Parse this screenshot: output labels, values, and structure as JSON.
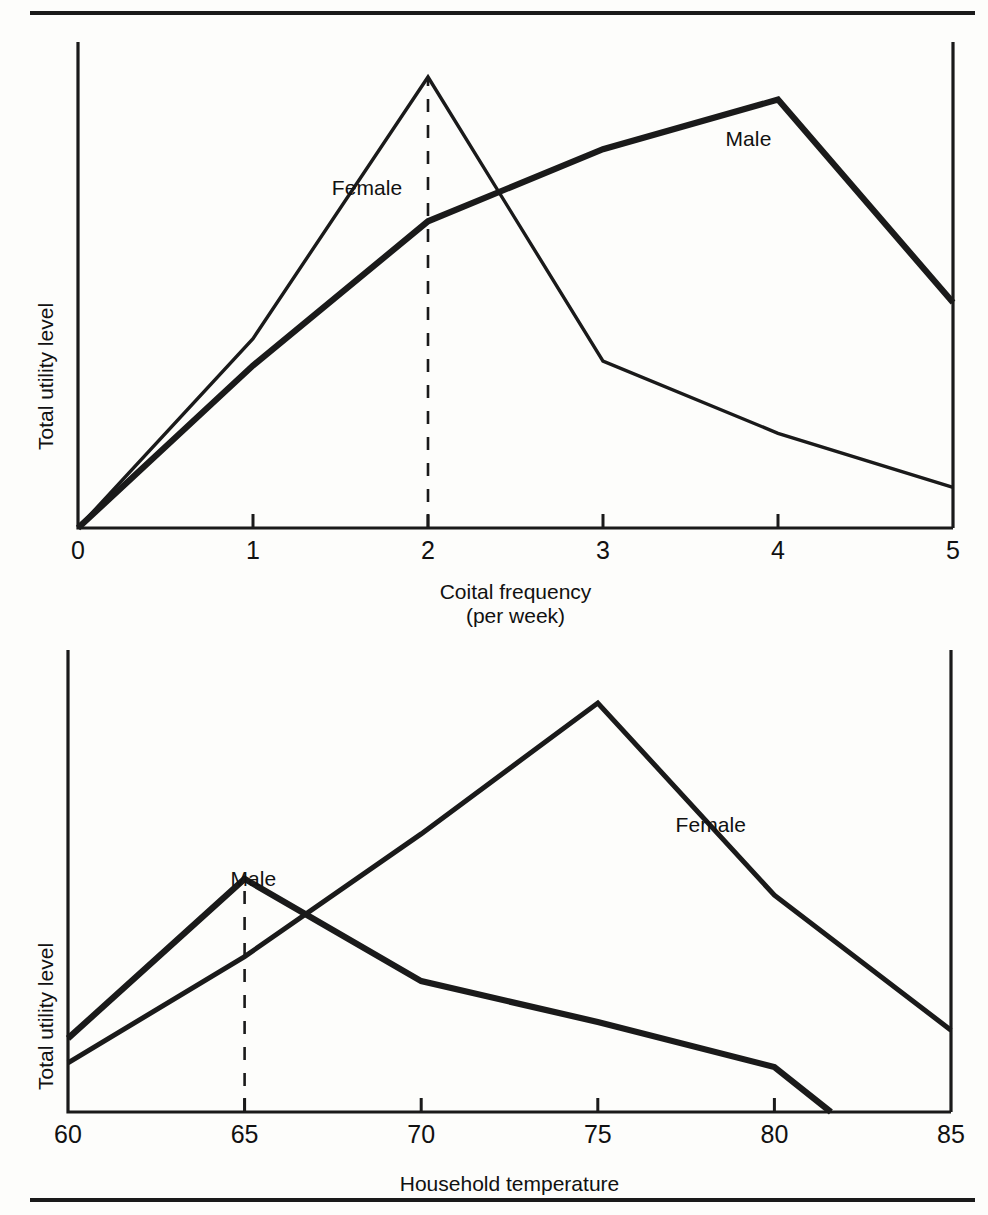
{
  "figure": {
    "background": "#fdfdfb",
    "ink": "#1a1a1a",
    "panels": [
      "coital",
      "temperature"
    ]
  },
  "chart_data": [
    {
      "id": "coital",
      "type": "line",
      "title": "",
      "xlabel": "Coital frequency",
      "xlabel_sub": "(per week)",
      "ylabel": "Total utility level",
      "xlim": [
        0,
        5
      ],
      "ylim": [
        0,
        100
      ],
      "xticks": [
        0,
        1,
        2,
        3,
        4,
        5
      ],
      "xticklabels": [
        "0",
        "1",
        "2",
        "3",
        "4",
        "5"
      ],
      "yticks": [],
      "yticklabels": [],
      "grid": false,
      "legend": "inline-annotations",
      "annotations": [
        {
          "text": "Female",
          "x": 1.45,
          "y": 78
        },
        {
          "text": "Male",
          "x": 3.7,
          "y": 89
        }
      ],
      "guides": [
        {
          "type": "dashed-vertical",
          "x": 2,
          "y_from": 0,
          "y_to": 100
        }
      ],
      "series": [
        {
          "name": "Female",
          "x": [
            0,
            1,
            2,
            3,
            4,
            5
          ],
          "y": [
            0,
            42,
            100,
            37,
            21,
            9
          ]
        },
        {
          "name": "Male",
          "x": [
            0,
            1,
            2,
            3,
            4,
            5
          ],
          "y": [
            0,
            36,
            68,
            84,
            95,
            50
          ]
        }
      ]
    },
    {
      "id": "temperature",
      "type": "line",
      "title": "",
      "xlabel": "Household temperature",
      "xlabel_sub": "",
      "ylabel": "Total utility level",
      "xlim": [
        60,
        85
      ],
      "ylim": [
        0,
        100
      ],
      "xticks": [
        60,
        65,
        70,
        75,
        80,
        85
      ],
      "xticklabels": [
        "60",
        "65",
        "70",
        "75",
        "80",
        "85"
      ],
      "yticks": [],
      "yticklabels": [],
      "grid": false,
      "legend": "inline-annotations",
      "annotations": [
        {
          "text": "Male",
          "x": 64.6,
          "y": 60
        },
        {
          "text": "Female",
          "x": 77.2,
          "y": 73
        }
      ],
      "guides": [
        {
          "type": "dashed-vertical",
          "x": 65,
          "y_from": 0,
          "y_to": 57
        }
      ],
      "series": [
        {
          "name": "Male",
          "x": [
            60,
            65,
            70,
            75,
            80,
            81.6
          ],
          "y": [
            18,
            57,
            32,
            22,
            11,
            0
          ]
        },
        {
          "name": "Female",
          "x": [
            60,
            65,
            70,
            75,
            80,
            85
          ],
          "y": [
            12,
            38,
            68,
            100,
            53,
            20
          ]
        }
      ]
    }
  ]
}
